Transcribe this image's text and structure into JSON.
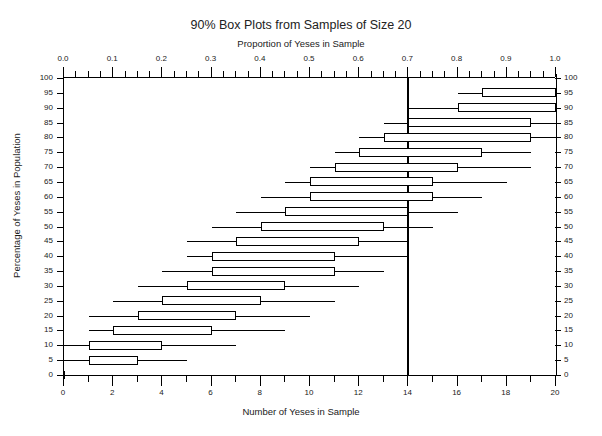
{
  "chart_data": {
    "type": "box",
    "title": "90% Box Plots from Samples of Size 20",
    "subtitle": "Proportion of Yeses in Sample",
    "xlabel": "Number of Yeses in Sample",
    "ylabel": "Percentage of Yeses in Population",
    "xlim": [
      0,
      20
    ],
    "ylim": [
      0,
      100
    ],
    "top_axis": {
      "label": "Proportion of Yeses in Sample",
      "range": [
        0.0,
        1.0
      ],
      "ticks": [
        "0.0",
        "0.1",
        "0.2",
        "0.3",
        "0.4",
        "0.5",
        "0.6",
        "0.7",
        "0.8",
        "0.9",
        "1.0"
      ],
      "tick_values": [
        0.0,
        0.1,
        0.2,
        0.3,
        0.4,
        0.5,
        0.6,
        0.7,
        0.8,
        0.9,
        1.0
      ]
    },
    "bottom_axis": {
      "label": "Number of Yeses in Sample",
      "range": [
        0,
        20
      ],
      "ticks": [
        "0",
        "2",
        "4",
        "6",
        "8",
        "10",
        "12",
        "14",
        "16",
        "18",
        "20"
      ],
      "tick_values": [
        0,
        2,
        4,
        6,
        8,
        10,
        12,
        14,
        16,
        18,
        20
      ]
    },
    "y_axis": {
      "label": "Percentage of Yeses in Population",
      "ticks": [
        "0",
        "5",
        "10",
        "15",
        "20",
        "25",
        "30",
        "35",
        "40",
        "45",
        "50",
        "55",
        "60",
        "65",
        "70",
        "75",
        "80",
        "85",
        "90",
        "95",
        "100"
      ],
      "tick_values": [
        0,
        5,
        10,
        15,
        20,
        25,
        30,
        35,
        40,
        45,
        50,
        55,
        60,
        65,
        70,
        75,
        80,
        85,
        90,
        95,
        100
      ]
    },
    "reference_line": {
      "value": 14,
      "proportion": 0.7,
      "orientation": "vertical"
    },
    "grid": false,
    "legend": null,
    "boxes": [
      {
        "y": 100,
        "lower_whisker": 20,
        "q1": 20,
        "q3": 20,
        "upper_whisker": 20
      },
      {
        "y": 95,
        "lower_whisker": 16,
        "q1": 17,
        "q3": 20,
        "upper_whisker": 20
      },
      {
        "y": 90,
        "lower_whisker": 14,
        "q1": 16,
        "q3": 20,
        "upper_whisker": 20
      },
      {
        "y": 85,
        "lower_whisker": 13,
        "q1": 14,
        "q3": 19,
        "upper_whisker": 20
      },
      {
        "y": 80,
        "lower_whisker": 12,
        "q1": 13,
        "q3": 19,
        "upper_whisker": 20
      },
      {
        "y": 75,
        "lower_whisker": 11,
        "q1": 12,
        "q3": 17,
        "upper_whisker": 19
      },
      {
        "y": 70,
        "lower_whisker": 10,
        "q1": 11,
        "q3": 16,
        "upper_whisker": 19
      },
      {
        "y": 65,
        "lower_whisker": 9,
        "q1": 10,
        "q3": 15,
        "upper_whisker": 18
      },
      {
        "y": 60,
        "lower_whisker": 8,
        "q1": 10,
        "q3": 15,
        "upper_whisker": 17
      },
      {
        "y": 55,
        "lower_whisker": 7,
        "q1": 9,
        "q3": 14,
        "upper_whisker": 16
      },
      {
        "y": 50,
        "lower_whisker": 6,
        "q1": 8,
        "q3": 13,
        "upper_whisker": 15
      },
      {
        "y": 45,
        "lower_whisker": 5,
        "q1": 7,
        "q3": 12,
        "upper_whisker": 14
      },
      {
        "y": 40,
        "lower_whisker": 5,
        "q1": 6,
        "q3": 11,
        "upper_whisker": 14
      },
      {
        "y": 35,
        "lower_whisker": 4,
        "q1": 6,
        "q3": 11,
        "upper_whisker": 13
      },
      {
        "y": 30,
        "lower_whisker": 3,
        "q1": 5,
        "q3": 9,
        "upper_whisker": 12
      },
      {
        "y": 25,
        "lower_whisker": 2,
        "q1": 4,
        "q3": 8,
        "upper_whisker": 11
      },
      {
        "y": 20,
        "lower_whisker": 1,
        "q1": 3,
        "q3": 7,
        "upper_whisker": 10
      },
      {
        "y": 15,
        "lower_whisker": 1,
        "q1": 2,
        "q3": 6,
        "upper_whisker": 9
      },
      {
        "y": 10,
        "lower_whisker": 0,
        "q1": 1,
        "q3": 4,
        "upper_whisker": 7
      },
      {
        "y": 5,
        "lower_whisker": 0,
        "q1": 1,
        "q3": 3,
        "upper_whisker": 5
      },
      {
        "y": 0,
        "lower_whisker": 0,
        "q1": 0,
        "q3": 0,
        "upper_whisker": 0
      }
    ]
  }
}
